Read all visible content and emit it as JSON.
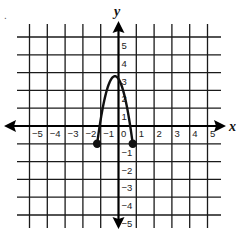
{
  "chart_data": {
    "type": "line",
    "title": "",
    "xlabel": "x",
    "ylabel": "y",
    "xlim": [
      -5,
      5
    ],
    "ylim": [
      -5,
      5
    ],
    "grid": true,
    "x_ticks": [
      "-5",
      "-4",
      "-3",
      "-2",
      "-1",
      "0",
      "1",
      "2",
      "3",
      "4",
      "5"
    ],
    "y_ticks": [
      "5",
      "4",
      "3",
      "2",
      "1",
      "-1",
      "-2",
      "-3",
      "-4",
      "-5"
    ],
    "series": [
      {
        "name": "parabola",
        "description": "downward-opening parabola segment with closed endpoints",
        "vertex": [
          -0.2,
          2.8
        ],
        "x": [
          -1.2,
          -1.0,
          -0.8,
          -0.6,
          -0.4,
          -0.2,
          0.0,
          0.2,
          0.4,
          0.6,
          0.8
        ],
        "y": [
          -1.0,
          0.35,
          1.5,
          2.3,
          2.7,
          2.8,
          2.7,
          2.3,
          1.5,
          0.35,
          -1.0
        ],
        "endpoints": [
          {
            "x": -1.2,
            "y": -1,
            "style": "closed"
          },
          {
            "x": 0.8,
            "y": -1,
            "style": "closed"
          }
        ]
      }
    ]
  },
  "labels": {
    "x_axis": "x",
    "y_axis": "y",
    "corner_mark": "."
  },
  "colors": {
    "grid": "#1a1a1a",
    "curve": "#111111",
    "background": "#ffffff"
  }
}
